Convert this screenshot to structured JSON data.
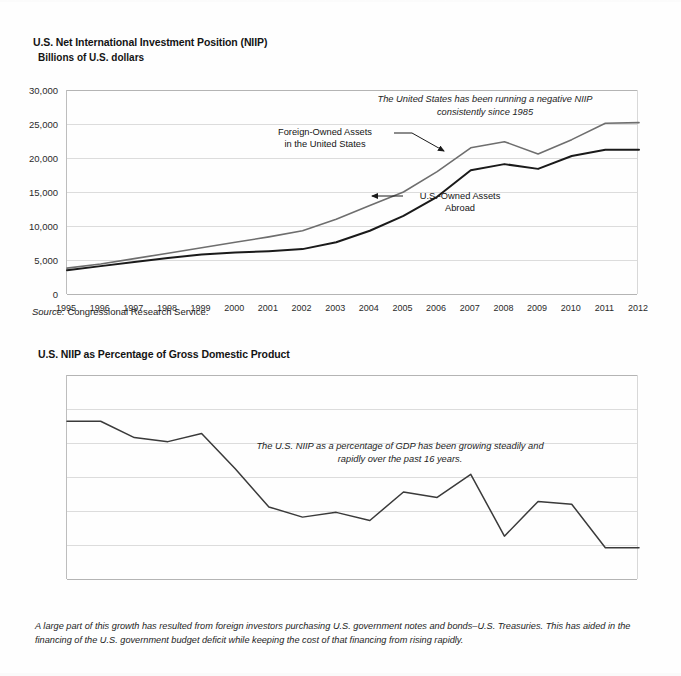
{
  "document": {
    "background_color": "#fefefe",
    "text_color": "#1a1a1a"
  },
  "chart1": {
    "title": "U.S. Net International Investment Position (NIIP)",
    "subtitle": "Billions of U.S. dollars",
    "annotation": "The United States has been running a negative NIIP\nconsistently since 1985",
    "label_foreign": "Foreign-Owned Assets\nin the United States",
    "label_usowned": "U.S.-Owned Assets\nAbroad",
    "source_prefix": "Source:",
    "source_text": "Congressional Research Service."
  },
  "chart2": {
    "title": "U.S. NIIP as Percentage of Gross Domestic Product",
    "annotation": "The U.S. NIIP as a percentage of GDP has been growing steadily and\nrapidly over the past 16 years."
  },
  "footnote": "A large part of this growth has resulted from foreign investors purchasing U.S. government notes and bonds–U.S. Treasuries. This has aided in the financing of the U.S. government budget deficit while keeping the cost of that financing from rising rapidly.",
  "chart_data": [
    {
      "type": "line",
      "title": "U.S. Net International Investment Position (NIIP)",
      "subtitle": "Billions of U.S. dollars",
      "xlabel": "",
      "ylabel": "Billions of U.S. dollars",
      "ylim": [
        0,
        30000
      ],
      "ytick_values": [
        0,
        5000,
        10000,
        15000,
        20000,
        25000,
        30000
      ],
      "ytick_labels": [
        "0",
        "5,000",
        "10,000",
        "15,000",
        "20,000",
        "25,000",
        "30,000"
      ],
      "grid": true,
      "legend": "annotated-inline",
      "categories": [
        1995,
        1996,
        1997,
        1998,
        1999,
        2000,
        2001,
        2002,
        2003,
        2004,
        2005,
        2006,
        2007,
        2008,
        2009,
        2010,
        2011,
        2012
      ],
      "xtick_labels": [
        "1995",
        "1996",
        "1997",
        "1998",
        "1999",
        "2000",
        "2001",
        "2002",
        "2003",
        "2004",
        "2005",
        "2006",
        "2007",
        "2008",
        "2009",
        "2010",
        "2011",
        "2012"
      ],
      "series": [
        {
          "name": "Foreign-Owned Assets in the United States",
          "color": "#6e6e6e",
          "width": 1.6,
          "values": [
            3800,
            4400,
            5200,
            6000,
            6800,
            7600,
            8400,
            9300,
            11000,
            13000,
            15000,
            18000,
            21500,
            22400,
            20600,
            22700,
            25100,
            25200
          ]
        },
        {
          "name": "U.S.-Owned Assets Abroad",
          "color": "#1a1a1a",
          "width": 2.0,
          "values": [
            3500,
            4100,
            4700,
            5300,
            5800,
            6100,
            6300,
            6600,
            7600,
            9300,
            11500,
            14300,
            18200,
            19100,
            18400,
            20300,
            21200,
            21200
          ]
        }
      ]
    },
    {
      "type": "line",
      "title": "U.S. NIIP as Percentage of Gross Domestic Product",
      "xlabel": "",
      "ylabel": "Percent of GDP",
      "ylim": [
        -30,
        0
      ],
      "ytick_values": [
        0,
        -5,
        -10,
        -15,
        -20,
        -25,
        -30
      ],
      "ytick_labels": [
        "0%",
        "–5%",
        "–10%",
        "–15%",
        "–20%",
        "–25%",
        "–30%"
      ],
      "grid": true,
      "categories": [
        1995,
        1996,
        1997,
        1998,
        1999,
        2000,
        2001,
        2002,
        2003,
        2004,
        2005,
        2006,
        2007,
        2008,
        2009,
        2010,
        2011,
        2012
      ],
      "xtick_labels": [
        "1995",
        "1996",
        "1997",
        "1998",
        "1999",
        "2000",
        "2001",
        "2002",
        "2003",
        "2004",
        "2005",
        "2006",
        "2007",
        "2008",
        "2009",
        "2010",
        "2011",
        "2012"
      ],
      "series": [
        {
          "name": "U.S. NIIP as percentage of GDP",
          "color": "#3a3a3a",
          "width": 1.5,
          "values": [
            -6.8,
            -6.8,
            -9.2,
            -9.8,
            -8.6,
            -13.8,
            -19.4,
            -20.9,
            -20.2,
            -21.4,
            -17.2,
            -18.0,
            -14.6,
            -23.7,
            -18.6,
            -19.0,
            -25.4,
            -25.4
          ]
        }
      ]
    }
  ]
}
